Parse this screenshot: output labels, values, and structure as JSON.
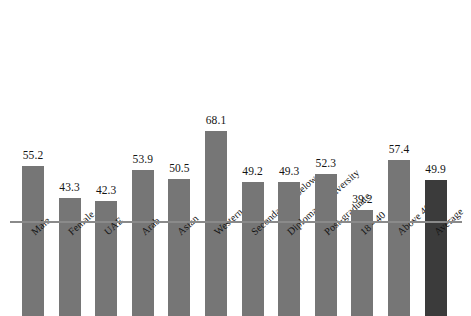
{
  "chart_data": {
    "type": "bar",
    "title": "",
    "subtitle": "",
    "xlabel": "",
    "ylabel": "",
    "ylim": [
      0,
      68.1
    ],
    "grid": false,
    "legend": "none",
    "categories": [
      "Male",
      "Female",
      "UAE",
      "Arab",
      "Asian",
      "Western",
      "Secondary or below",
      "Diploma or university",
      "Post-graduate",
      "18 - 40",
      "Above 40",
      "Average"
    ],
    "values": [
      55.2,
      43.3,
      42.3,
      53.9,
      50.5,
      68.1,
      49.2,
      49.3,
      52.3,
      39.2,
      57.4,
      49.9
    ],
    "value_labels": [
      "55.2",
      "43.3",
      "42.3",
      "53.9",
      "50.5",
      "68.1",
      "49.2",
      "49.3",
      "52.3",
      "39.2",
      "57.4",
      "49.9"
    ],
    "bar_colors": [
      "#767676",
      "#767676",
      "#767676",
      "#767676",
      "#767676",
      "#767676",
      "#767676",
      "#767676",
      "#767676",
      "#767676",
      "#767676",
      "#3b3b3b"
    ],
    "axis_color": "#8a8a8a",
    "background_color": "#ffffff",
    "label_rotation_deg": -42
  }
}
